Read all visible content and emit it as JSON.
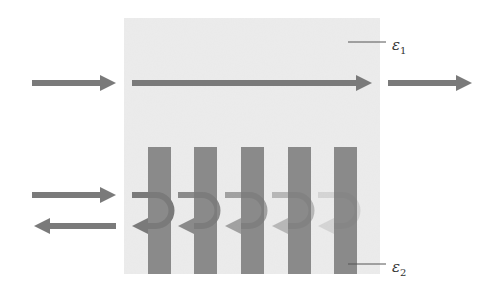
{
  "diagram": {
    "type": "wave-transmission-vs-reflection",
    "colors": {
      "background": "#ffffff",
      "medium": "#ececec",
      "arrow": "#7a7a7a",
      "bars": "#8a8a8a",
      "leader_line": "#555555"
    },
    "medium_box": {
      "x": 124,
      "y": 18,
      "width": 256,
      "height": 256
    },
    "labels": [
      {
        "id": "eps1",
        "symbol": "ε",
        "subscript": "1",
        "x": 392,
        "y": 36
      },
      {
        "id": "eps2",
        "symbol": "ε",
        "subscript": "2",
        "x": 392,
        "y": 258
      }
    ],
    "top_row": {
      "description": "Uniform medium ε1: wave transmits straight through",
      "incident_arrow": {
        "x1": 32,
        "x2": 116,
        "y": 83
      },
      "inside_arrow": {
        "x1": 132,
        "x2": 372,
        "y": 83
      },
      "transmitted_arrow": {
        "x1": 388,
        "x2": 472,
        "y": 83
      }
    },
    "bottom_row": {
      "description": "Periodic layers ε2: wave reflects progressively",
      "incident_arrow": {
        "x1": 32,
        "x2": 116,
        "y": 195
      },
      "reflected_arrow": {
        "x1": 116,
        "x2": 34,
        "y": 226
      },
      "bars": [
        {
          "x": 148,
          "width": 23
        },
        {
          "x": 194,
          "width": 23
        },
        {
          "x": 241,
          "width": 23
        },
        {
          "x": 288,
          "width": 23
        },
        {
          "x": 334,
          "width": 23
        }
      ],
      "bar_top": 147,
      "bar_bottom": 274,
      "u_turn_arrows": [
        {
          "x": 132,
          "opacity": 1.0
        },
        {
          "x": 178,
          "opacity": 0.85
        },
        {
          "x": 225,
          "opacity": 0.65
        },
        {
          "x": 272,
          "opacity": 0.45
        },
        {
          "x": 318,
          "opacity": 0.2
        }
      ]
    }
  }
}
